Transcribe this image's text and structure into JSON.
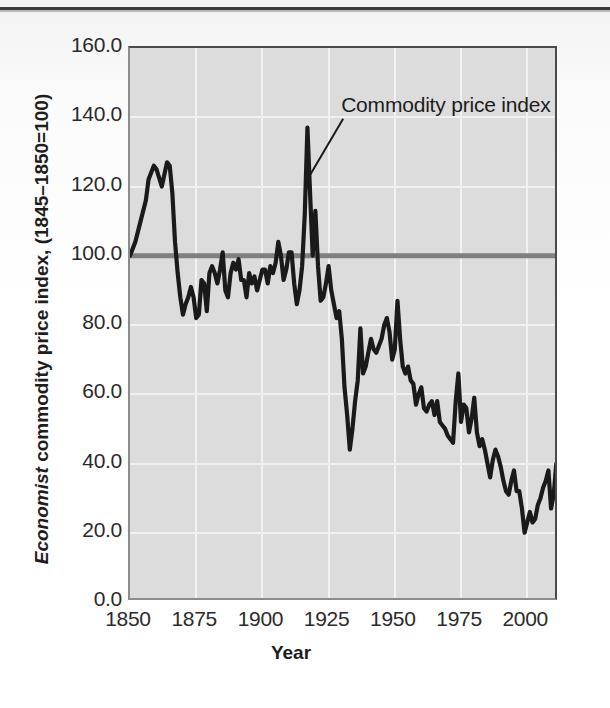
{
  "figure": {
    "annotation_label": "Commodity price index",
    "xaxis_title": "Year",
    "yaxis_title_italic": "Economist",
    "yaxis_title_rest": " commodity price index, (1845–1850=100)",
    "plot_bg_color": "#dcdcdc",
    "series_color": "#1a1a1a",
    "reference_line_color": "#808080",
    "grid_color": "#f2f2f2"
  },
  "chart_data": {
    "type": "line",
    "title": "",
    "subtitle": "",
    "xlabel": "Year",
    "ylabel": "Economist commodity price index, (1845–1850=100)",
    "xlim": [
      1850,
      2012
    ],
    "ylim": [
      0.0,
      160.0
    ],
    "xticks": [
      1850,
      1875,
      1900,
      1925,
      1950,
      1975,
      2000
    ],
    "yticks": [
      0.0,
      20.0,
      40.0,
      60.0,
      80.0,
      100.0,
      120.0,
      140.0,
      160.0
    ],
    "ytick_labels": [
      "0.0",
      "20.0",
      "40.0",
      "60.0",
      "80.0",
      "100.0",
      "120.0",
      "140.0",
      "160.0"
    ],
    "xtick_labels": [
      "1850",
      "1875",
      "1900",
      "1925",
      "1950",
      "1975",
      "2000"
    ],
    "grid": true,
    "legend": false,
    "annotations": [
      {
        "text": "Commodity price index",
        "x": 1917,
        "y": 137,
        "label_x": 1932,
        "label_y": 143
      }
    ],
    "reference_lines": [
      {
        "y": 100,
        "label": "",
        "color": "#808080"
      }
    ],
    "series": [
      {
        "name": "Commodity price index",
        "color": "#1a1a1a",
        "x": [
          1850,
          1852,
          1854,
          1856,
          1857,
          1859,
          1860,
          1862,
          1864,
          1865,
          1866,
          1867,
          1868,
          1869,
          1870,
          1871,
          1872,
          1873,
          1874,
          1875,
          1876,
          1877,
          1878,
          1879,
          1880,
          1881,
          1882,
          1883,
          1884,
          1885,
          1886,
          1887,
          1888,
          1889,
          1890,
          1891,
          1892,
          1893,
          1894,
          1895,
          1896,
          1897,
          1898,
          1899,
          1900,
          1901,
          1902,
          1903,
          1904,
          1905,
          1906,
          1907,
          1908,
          1909,
          1910,
          1911,
          1912,
          1913,
          1914,
          1915,
          1916,
          1917,
          1918,
          1919,
          1920,
          1921,
          1922,
          1923,
          1924,
          1925,
          1926,
          1927,
          1928,
          1929,
          1930,
          1931,
          1932,
          1933,
          1934,
          1935,
          1936,
          1937,
          1938,
          1939,
          1940,
          1941,
          1942,
          1943,
          1944,
          1945,
          1946,
          1947,
          1948,
          1949,
          1950,
          1951,
          1952,
          1953,
          1954,
          1955,
          1956,
          1957,
          1958,
          1959,
          1960,
          1961,
          1962,
          1963,
          1964,
          1965,
          1966,
          1967,
          1968,
          1969,
          1970,
          1971,
          1972,
          1973,
          1974,
          1975,
          1976,
          1977,
          1978,
          1979,
          1980,
          1981,
          1982,
          1983,
          1984,
          1985,
          1986,
          1987,
          1988,
          1989,
          1990,
          1991,
          1992,
          1993,
          1994,
          1995,
          1996,
          1997,
          1998,
          1999,
          2000,
          2001,
          2002,
          2003,
          2004,
          2005,
          2006,
          2007,
          2008,
          2009,
          2010,
          2011
        ],
        "y": [
          100,
          104,
          110,
          116,
          122,
          126,
          125,
          120,
          127,
          126,
          118,
          104,
          95,
          88,
          83,
          86,
          88,
          91,
          88,
          82,
          83,
          93,
          92,
          84,
          95,
          97,
          95,
          92,
          96,
          101,
          90,
          88,
          95,
          98,
          96,
          99,
          93,
          93,
          88,
          95,
          92,
          94,
          90,
          93,
          96,
          96,
          92,
          97,
          95,
          98,
          104,
          100,
          93,
          96,
          101,
          101,
          92,
          86,
          90,
          97,
          112,
          137,
          118,
          100,
          113,
          97,
          87,
          88,
          92,
          97,
          90,
          86,
          82,
          84,
          76,
          62,
          54,
          44,
          50,
          58,
          64,
          79,
          66,
          68,
          72,
          76,
          73,
          72,
          74,
          76,
          80,
          82,
          78,
          70,
          73,
          87,
          76,
          68,
          66,
          68,
          64,
          63,
          57,
          60,
          62,
          56,
          55,
          57,
          58,
          54,
          58,
          52,
          51,
          50,
          48,
          47,
          46,
          58,
          66,
          52,
          57,
          56,
          49,
          53,
          59,
          49,
          45,
          47,
          44,
          40,
          36,
          41,
          44,
          42,
          39,
          35,
          32,
          31,
          35,
          38,
          32,
          32,
          27,
          20,
          23,
          26,
          23,
          24,
          28,
          30,
          33,
          35,
          38,
          27,
          31,
          40
        ]
      }
    ]
  }
}
